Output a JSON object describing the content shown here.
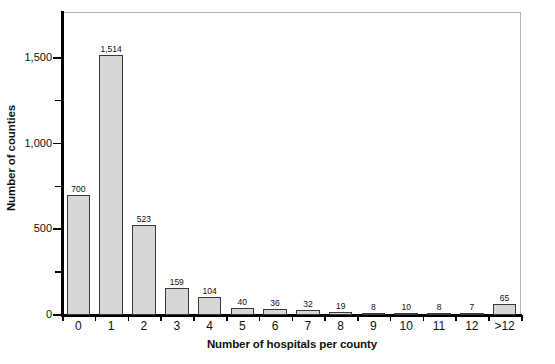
{
  "chart_data": {
    "type": "bar",
    "title": "",
    "xlabel": "Number of hospitals per county",
    "ylabel": "Number of counties",
    "categories": [
      "0",
      "1",
      "2",
      "3",
      "4",
      "5",
      "6",
      "7",
      "8",
      "9",
      "10",
      "11",
      "12",
      ">12"
    ],
    "values": [
      700,
      1514,
      523,
      159,
      104,
      40,
      36,
      32,
      19,
      8,
      10,
      8,
      7,
      65
    ],
    "value_labels": [
      "700",
      "1,514",
      "523",
      "159",
      "104",
      "40",
      "36",
      "32",
      "19",
      "8",
      "10",
      "8",
      "7",
      "65"
    ],
    "ylim": [
      0,
      1767
    ],
    "ytick_major_values": [
      0,
      500,
      1000,
      1500
    ],
    "ytick_major_labels": [
      "0",
      "500",
      "1,000",
      "1,500"
    ],
    "ytick_minor_values": [
      250,
      750,
      1250
    ],
    "grid": false,
    "legend": null,
    "bar_fill_color": "#d6d6d6",
    "bar_edge_color": "#3a3a3a",
    "axis_color": "#000000",
    "frame_color": "#b4b4b4",
    "background_color": "#ffffff"
  }
}
